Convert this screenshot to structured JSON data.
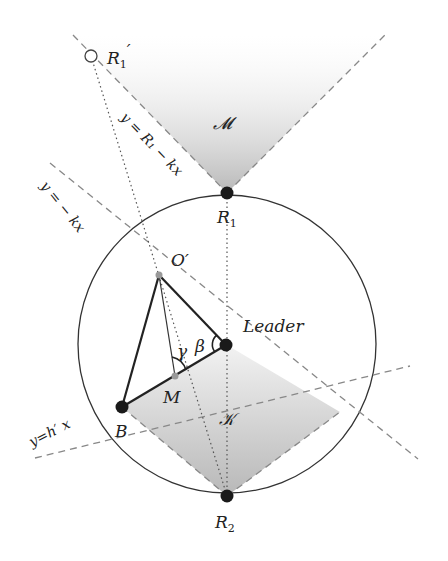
{
  "diagram": {
    "regions": {
      "upper": {
        "label": "𝓜"
      },
      "lower": {
        "label": "𝒦"
      }
    },
    "points": {
      "R1_prime": {
        "label": "R",
        "sub": "1",
        "prime": "′"
      },
      "R1": {
        "label": "R",
        "sub": "1"
      },
      "R2": {
        "label": "R",
        "sub": "2"
      },
      "O_prime": {
        "label": "O′"
      },
      "leader": {
        "label": "Leader"
      },
      "M": {
        "label": "M"
      },
      "B": {
        "label": "B"
      }
    },
    "angles": {
      "gamma": "γ",
      "beta": "β"
    },
    "lines": {
      "upper_left": "y = R₁ − kx",
      "neg_kx": "y = − kx",
      "h_prime": "y=h′ x"
    },
    "colors": {
      "stroke": "#222222",
      "dashed": "#888888",
      "shade": "#c8c8c8",
      "point": "#1a1a1a",
      "minor_point": "#999999"
    }
  }
}
